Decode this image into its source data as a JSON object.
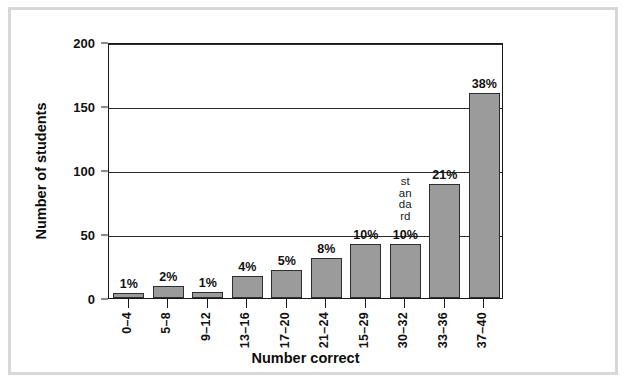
{
  "chart_data": {
    "type": "bar",
    "title": "",
    "xlabel": "Number correct",
    "ylabel": "Number of students",
    "categories": [
      "0–4",
      "5–8",
      "9–12",
      "13–16",
      "17–20",
      "21–24",
      "15–29",
      "30–32",
      "33–36",
      "37–40"
    ],
    "values": [
      4,
      9,
      5,
      17,
      22,
      31,
      42,
      42,
      89,
      160
    ],
    "data_labels": [
      "1%",
      "2%",
      "1%",
      "4%",
      "5%",
      "8%",
      "10%",
      "10%",
      "21%",
      "38%"
    ],
    "ylim": [
      0,
      200
    ],
    "yticks": [
      0,
      50,
      100,
      150,
      200
    ],
    "ytick_labels": [
      "0",
      "50",
      "100",
      "150",
      "200"
    ],
    "grid": true,
    "legend": "none",
    "bar_color": "#9b9b9b",
    "bar_edge_color": "#2e2e2e",
    "axis_color": "#1a1a1a",
    "annotations": [
      {
        "text": "standard",
        "orientation": "vertical-stacked",
        "at_category": "30–32"
      }
    ]
  },
  "frame": {
    "border_color": "#d7d7d7",
    "background": "#ffffff"
  }
}
